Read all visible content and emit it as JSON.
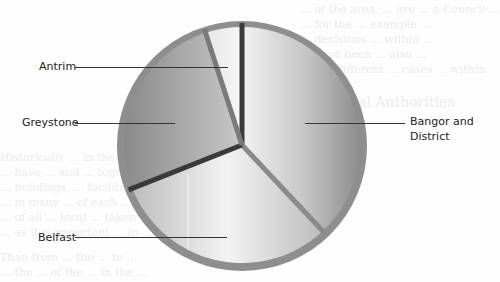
{
  "chart_data": {
    "type": "pie",
    "title": "",
    "start_angle_deg": 0,
    "direction": "clockwise",
    "categories": [
      "Bangor and District",
      "Belfast",
      "Greystone",
      "Antrim"
    ],
    "values": [
      38,
      31,
      26,
      5
    ],
    "unit": "percent (estimated from slice angles)",
    "legend": "none (leader-line labels)",
    "labels": [
      {
        "text": "Antrim",
        "side": "left"
      },
      {
        "text": "Greystone",
        "side": "left"
      },
      {
        "text": "Belfast",
        "side": "left"
      },
      {
        "text": "Bangor and District",
        "side": "right"
      }
    ],
    "colors": [
      "#b8b8b8",
      "#d4d4d4",
      "#8f8f8f",
      "#e2e2e2"
    ]
  },
  "labels": {
    "antrim": "Antrim",
    "greystone": "Greystone",
    "belfast": "Belfast",
    "bangor_line1": "Bangor and",
    "bangor_line2": "District"
  },
  "background_text": {
    "line1": "… of the area, … are … a Council …",
    "line2": "… for the … example …",
    "line3": "… decisions … within …",
    "line4": "… have been … also …",
    "line5": "of the different … cases … within",
    "line6": "Municipal Authorities",
    "line7": "Historically … in the … Council … over",
    "line8": "… have … and … together …",
    "line9": "… buildings, … facilities …",
    "line10": "… in many … of each …",
    "line11": "… of all … local … taken …",
    "line12": "… as it is important … in …",
    "line13": "Than from … the … to …",
    "line14": "… the … of the … in the …"
  }
}
